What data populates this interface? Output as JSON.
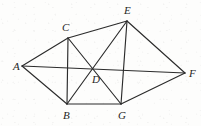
{
  "figure": {
    "kind": "geometry-diagram",
    "background_color": "#fdfdfc",
    "line_color": "#2b2b2b",
    "label_color": "#262626",
    "width": 201,
    "height": 126,
    "vertices": [
      {
        "id": "A",
        "label": "A",
        "x": 22,
        "y": 66,
        "label_x": 13,
        "label_y": 70
      },
      {
        "id": "B",
        "label": "B",
        "x": 67,
        "y": 104,
        "label_x": 63,
        "label_y": 119
      },
      {
        "id": "C",
        "label": "C",
        "x": 68,
        "y": 38,
        "label_x": 62,
        "label_y": 31
      },
      {
        "id": "D",
        "label": "D",
        "x": 97,
        "y": 68,
        "label_x": 92,
        "label_y": 83
      },
      {
        "id": "E",
        "label": "E",
        "x": 127,
        "y": 21,
        "label_x": 124,
        "label_y": 14
      },
      {
        "id": "F",
        "label": "F",
        "x": 185,
        "y": 73,
        "label_x": 189,
        "label_y": 77
      },
      {
        "id": "G",
        "label": "G",
        "x": 121,
        "y": 104,
        "label_x": 118,
        "label_y": 119
      }
    ],
    "edges": [
      {
        "id": "A-C",
        "from": "A",
        "to": "C"
      },
      {
        "id": "A-B",
        "from": "A",
        "to": "B"
      },
      {
        "id": "A-F",
        "from": "A",
        "to": "F"
      },
      {
        "id": "C-E",
        "from": "C",
        "to": "E"
      },
      {
        "id": "C-B",
        "from": "C",
        "to": "B"
      },
      {
        "id": "C-G",
        "from": "C",
        "to": "G"
      },
      {
        "id": "E-B",
        "from": "E",
        "to": "B"
      },
      {
        "id": "E-G",
        "from": "E",
        "to": "G"
      },
      {
        "id": "E-F",
        "from": "E",
        "to": "F"
      },
      {
        "id": "B-G",
        "from": "B",
        "to": "G"
      },
      {
        "id": "G-F",
        "from": "G",
        "to": "F"
      }
    ]
  }
}
